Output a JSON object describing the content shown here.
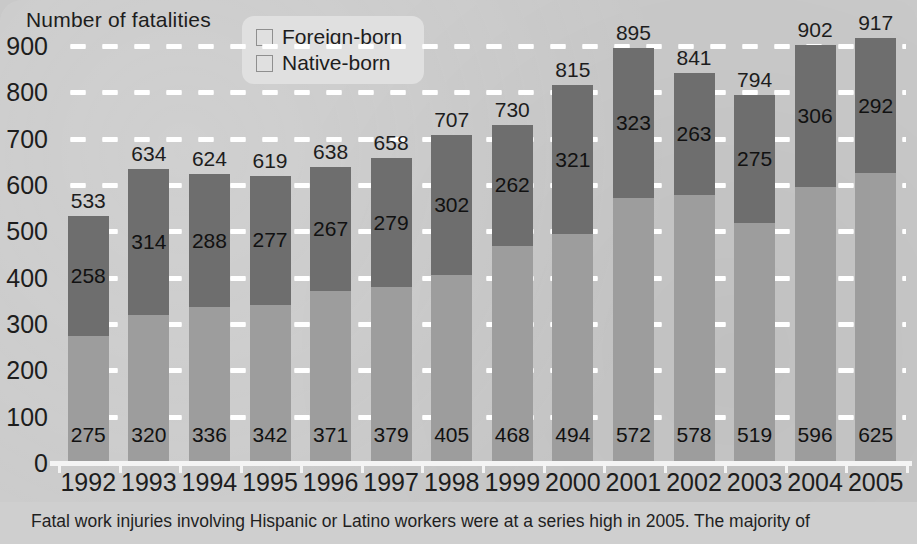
{
  "axis_title": "Number of fatalities",
  "legend": {
    "items": [
      {
        "label": "Foreign-born",
        "color": "#9d9d9d",
        "icon": "square-swatch-icon"
      },
      {
        "label": "Native-born",
        "color": "#6e6e6e",
        "icon": "square-swatch-icon"
      }
    ]
  },
  "y_axis": {
    "ticks": [
      "900",
      "800",
      "700",
      "600",
      "500",
      "400",
      "300",
      "200",
      "100",
      "0"
    ],
    "min": 0,
    "max": 900,
    "step": 100
  },
  "caption": "Fatal work injuries involving Hispanic or Latino workers were at a series high in 2005. The majority of",
  "chart_data": {
    "type": "bar",
    "title": "",
    "subtitle": "",
    "xlabel": "",
    "ylabel": "Number of fatalities",
    "ylim": [
      0,
      900
    ],
    "grid": true,
    "stacked": true,
    "legend_position": "top-center",
    "categories": [
      "1992",
      "1993",
      "1994",
      "1995",
      "1996",
      "1997",
      "1998",
      "1999",
      "2000",
      "2001",
      "2002",
      "2003",
      "2004",
      "2005"
    ],
    "series": [
      {
        "name": "Foreign-born",
        "color": "#9d9d9d",
        "values": [
          275,
          320,
          336,
          342,
          371,
          379,
          405,
          468,
          494,
          572,
          578,
          519,
          596,
          625
        ]
      },
      {
        "name": "Native-born",
        "color": "#6e6e6e",
        "values": [
          258,
          314,
          288,
          277,
          267,
          279,
          302,
          262,
          321,
          323,
          263,
          275,
          306,
          292
        ]
      }
    ],
    "totals": [
      533,
      634,
      624,
      619,
      638,
      658,
      707,
      730,
      815,
      895,
      841,
      794,
      902,
      917
    ],
    "annotations": [
      "Segment values labeled inside each bar segment",
      "Totals labeled above each bar"
    ]
  }
}
